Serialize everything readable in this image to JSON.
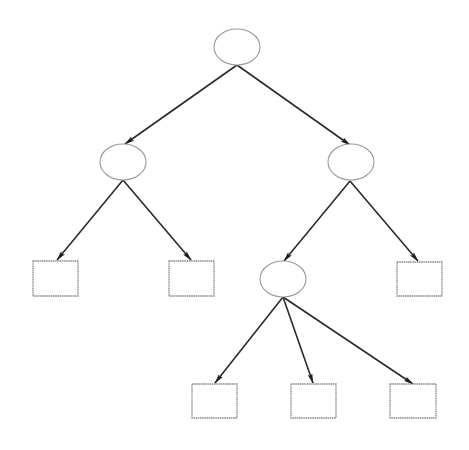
{
  "diagram": {
    "type": "tree",
    "background": "#ffffff",
    "colors": {
      "edge": "#2b2b2b",
      "arrowhead": "#1e1e1e",
      "ellipse_stroke": "#9a9a9a",
      "box_stroke": "#8c8c8c"
    },
    "nodes": [
      {
        "id": "root",
        "shape": "ellipse",
        "cx": 237,
        "cy": 47,
        "rx": 23,
        "ry": 18,
        "label": ""
      },
      {
        "id": "left-internal",
        "shape": "ellipse",
        "cx": 123,
        "cy": 162,
        "rx": 23,
        "ry": 18,
        "label": ""
      },
      {
        "id": "right-internal",
        "shape": "ellipse",
        "cx": 351,
        "cy": 162,
        "rx": 23,
        "ry": 18,
        "label": ""
      },
      {
        "id": "lower-internal",
        "shape": "ellipse",
        "cx": 283,
        "cy": 279,
        "rx": 23,
        "ry": 18,
        "label": ""
      },
      {
        "id": "leaf-1",
        "shape": "box",
        "x": 33,
        "y": 261,
        "w": 45,
        "h": 35,
        "label": ""
      },
      {
        "id": "leaf-2",
        "shape": "box",
        "x": 169,
        "y": 261,
        "w": 45,
        "h": 35,
        "label": ""
      },
      {
        "id": "leaf-3",
        "shape": "box",
        "x": 397,
        "y": 262,
        "w": 45,
        "h": 34,
        "label": ""
      },
      {
        "id": "leaf-4",
        "shape": "box",
        "x": 192,
        "y": 384,
        "w": 45,
        "h": 34,
        "label": ""
      },
      {
        "id": "leaf-5",
        "shape": "box",
        "x": 291,
        "y": 384,
        "w": 45,
        "h": 34,
        "label": ""
      },
      {
        "id": "leaf-6",
        "shape": "box",
        "x": 390,
        "y": 384,
        "w": 46,
        "h": 34,
        "label": ""
      }
    ],
    "edges": [
      {
        "from": "root",
        "to": "left-internal",
        "x1": 237,
        "y1": 65,
        "x2": 125,
        "y2": 144
      },
      {
        "from": "root",
        "to": "right-internal",
        "x1": 237,
        "y1": 65,
        "x2": 350,
        "y2": 145
      },
      {
        "from": "left-internal",
        "to": "leaf-1",
        "x1": 123,
        "y1": 180,
        "x2": 57,
        "y2": 260
      },
      {
        "from": "left-internal",
        "to": "leaf-2",
        "x1": 123,
        "y1": 180,
        "x2": 191,
        "y2": 260
      },
      {
        "from": "right-internal",
        "to": "lower-internal",
        "x1": 350,
        "y1": 181,
        "x2": 284,
        "y2": 261
      },
      {
        "from": "right-internal",
        "to": "leaf-3",
        "x1": 350,
        "y1": 181,
        "x2": 418,
        "y2": 261
      },
      {
        "from": "lower-internal",
        "to": "leaf-4",
        "x1": 283,
        "y1": 297,
        "x2": 215,
        "y2": 383
      },
      {
        "from": "lower-internal",
        "to": "leaf-5",
        "x1": 283,
        "y1": 297,
        "x2": 313,
        "y2": 383
      },
      {
        "from": "lower-internal",
        "to": "leaf-6",
        "x1": 283,
        "y1": 297,
        "x2": 413,
        "y2": 384
      }
    ]
  }
}
